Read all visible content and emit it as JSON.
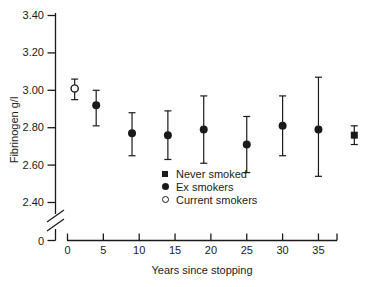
{
  "chart_data": {
    "type": "scatter",
    "title": "",
    "xlabel": "Years since stopping",
    "ylabel": "Fibrinogen g/l",
    "ylim": [
      2.4,
      3.4
    ],
    "y_ticks": [
      "3.40",
      "3.20",
      "3.00",
      "2.80",
      "2.60",
      "2.40"
    ],
    "y_zero_label": "0",
    "y_axis_break": true,
    "x_ticks": [
      0,
      5,
      10,
      15,
      20,
      25,
      30,
      35
    ],
    "grid": false,
    "error_bars": true,
    "color": "#1a1a1a",
    "background": "#ffffff",
    "series": [
      {
        "name": "Current smokers",
        "marker": "open-circle",
        "points": [
          {
            "x": 1,
            "y": 3.01,
            "lo": 2.95,
            "hi": 3.06
          }
        ]
      },
      {
        "name": "Ex smokers",
        "marker": "filled-circle",
        "points": [
          {
            "x": 4,
            "y": 2.92,
            "lo": 2.81,
            "hi": 3.0
          },
          {
            "x": 9,
            "y": 2.77,
            "lo": 2.65,
            "hi": 2.88
          },
          {
            "x": 14,
            "y": 2.76,
            "lo": 2.63,
            "hi": 2.89
          },
          {
            "x": 19,
            "y": 2.79,
            "lo": 2.61,
            "hi": 2.97
          },
          {
            "x": 25,
            "y": 2.71,
            "lo": 2.56,
            "hi": 2.86
          },
          {
            "x": 30,
            "y": 2.81,
            "lo": 2.65,
            "hi": 2.97
          },
          {
            "x": 35,
            "y": 2.79,
            "lo": 2.54,
            "hi": 3.07
          }
        ]
      },
      {
        "name": "Never smoked",
        "marker": "filled-square",
        "points": [
          {
            "x": 40,
            "y": 2.76,
            "lo": 2.71,
            "hi": 2.81
          }
        ]
      }
    ],
    "legend": [
      {
        "marker": "filled-square",
        "label": "Never smoked"
      },
      {
        "marker": "filled-circle",
        "label": "Ex smokers"
      },
      {
        "marker": "open-circle",
        "label": "Current smokers"
      }
    ],
    "legend_position": "inside-lower-middle"
  }
}
